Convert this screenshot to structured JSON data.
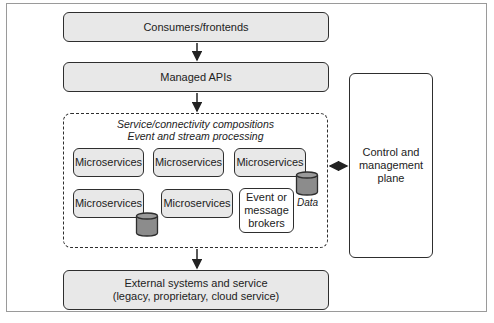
{
  "diagram": {
    "consumers": "Consumers/frontends",
    "managed_apis": "Managed APIs",
    "composition_caption_line1": "Service/connectivity compositions",
    "composition_caption_line2": "Event and stream processing",
    "microservices": [
      {
        "label": "Microservices",
        "has_data": false
      },
      {
        "label": "Microservices",
        "has_data": false
      },
      {
        "label": "Microservices",
        "has_data": true
      },
      {
        "label": "Microservices",
        "has_data": true
      },
      {
        "label": "Microservices",
        "has_data": false
      }
    ],
    "brokers": "Event or message brokers",
    "data_label": "Data",
    "control_plane": "Control and management plane",
    "external_line1": "External systems and service",
    "external_line2": "(legacy, proprietary, cloud service)"
  },
  "colors": {
    "box_fill": "#e8e8e8",
    "cylinder_fill": "#8c8c8c",
    "stroke": "#2e2e2e"
  }
}
